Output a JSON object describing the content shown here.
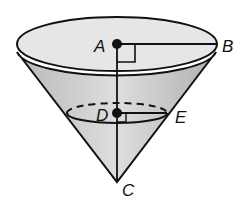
{
  "figure": {
    "type": "cone-cross-section",
    "labels": {
      "A": "A",
      "B": "B",
      "C": "C",
      "D": "D",
      "E": "E"
    },
    "colors": {
      "top_face": "#e8e8e8",
      "side": "#c4c4c4",
      "line": "#111111"
    }
  }
}
